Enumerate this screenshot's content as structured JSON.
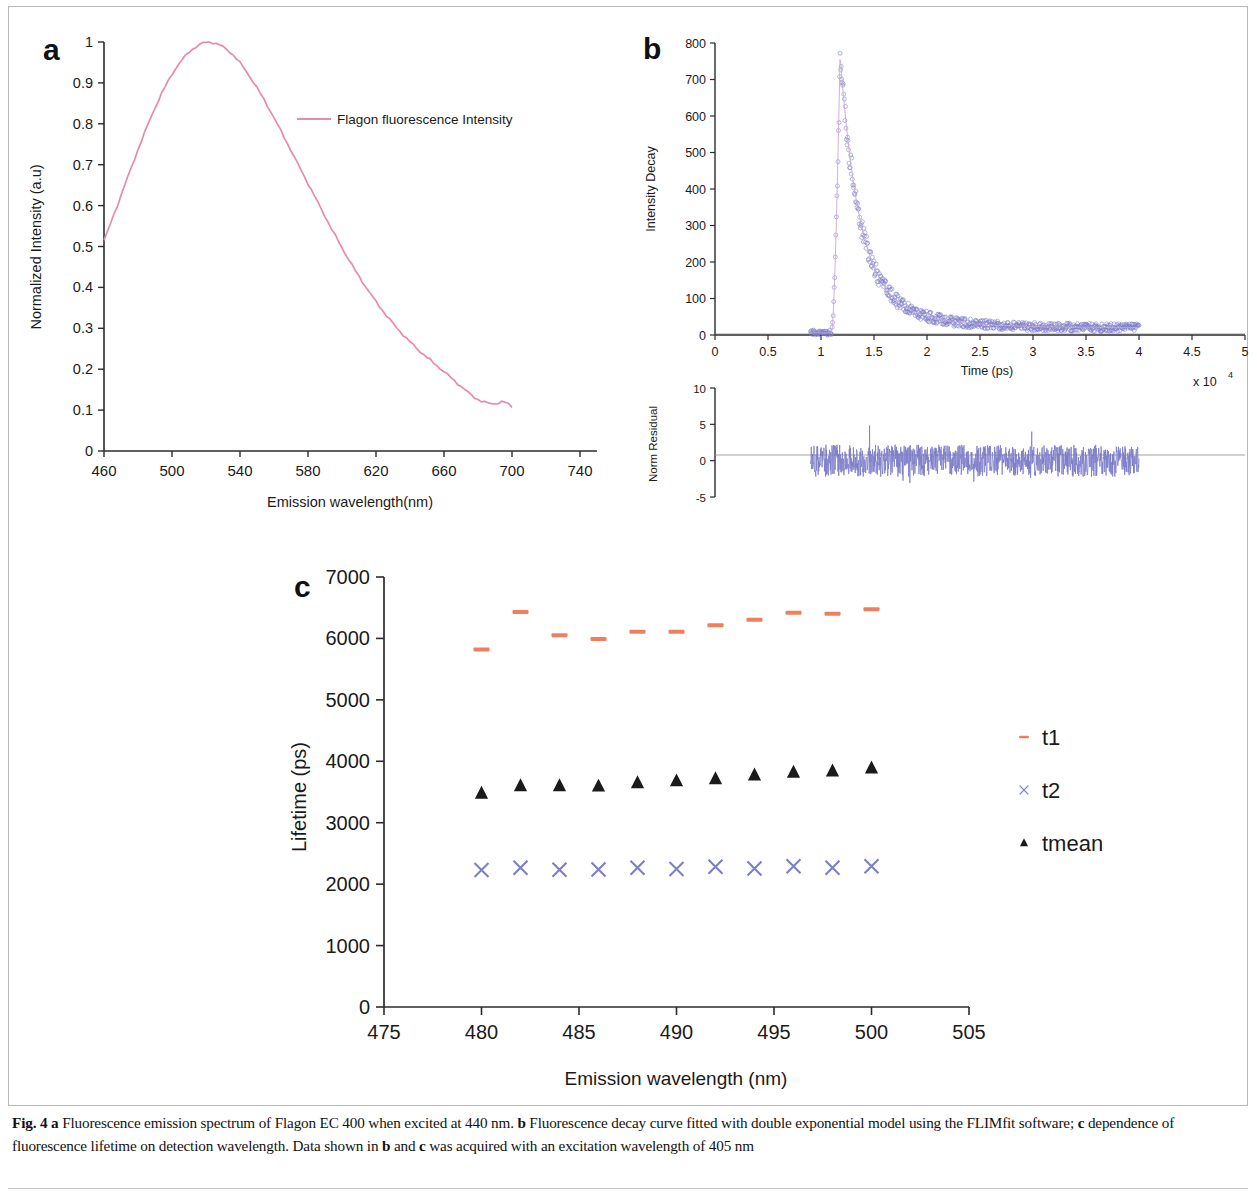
{
  "figure": {
    "caption_label": "Fig. 4",
    "caption_segments": [
      {
        "text": "Fig. 4",
        "bold": true
      },
      {
        "text": " ",
        "bold": false
      },
      {
        "text": "a",
        "bold": true
      },
      {
        "text": " Fluorescence emission spectrum of Flagon EC 400 when excited at 440 nm. ",
        "bold": false
      },
      {
        "text": "b",
        "bold": true
      },
      {
        "text": " Fluorescence decay curve fitted with double exponential model using the FLIMfit software; ",
        "bold": false
      },
      {
        "text": "c",
        "bold": true
      },
      {
        "text": " dependence of fluorescence lifetime on detection wavelength. Data shown in ",
        "bold": false
      },
      {
        "text": "b",
        "bold": true
      },
      {
        "text": " and ",
        "bold": false
      },
      {
        "text": "c",
        "bold": true
      },
      {
        "text": " was acquired with an excitation wavelength of 405 nm",
        "bold": false
      }
    ],
    "caption_plain": "Fig. 4 a Fluorescence emission spectrum of Flagon EC 400 when excited at 440 nm. b Fluorescence decay curve fitted with double exponential model using the FLIMfit software; c dependence of fluorescence lifetime on detection wavelength. Data shown in b and c was acquired with an excitation wavelength of 405 nm"
  },
  "panel_a": {
    "letter": "a",
    "legend_label": "Flagon fluorescence Intensity",
    "line_color": "#e58bb0",
    "chart_data": {
      "type": "line",
      "title": "",
      "xlabel": "Emission wavelength(nm)",
      "ylabel": "Normalized Intensity (a.u)",
      "xlim": [
        460,
        750
      ],
      "ylim": [
        0,
        1
      ],
      "xticks": [
        460,
        500,
        540,
        580,
        620,
        660,
        700,
        740
      ],
      "yticks": [
        0,
        0.1,
        0.2,
        0.3,
        0.4,
        0.5,
        0.6,
        0.7,
        0.8,
        0.9,
        1
      ],
      "grid": false,
      "legend_position": "inside-upper-right",
      "series": [
        {
          "name": "Flagon fluorescence Intensity",
          "color": "#e58bb0",
          "x": [
            460,
            462,
            464,
            466,
            468,
            470,
            472,
            474,
            476,
            478,
            480,
            482,
            484,
            486,
            488,
            490,
            492,
            494,
            496,
            498,
            500,
            502,
            504,
            506,
            508,
            510,
            512,
            514,
            516,
            518,
            520,
            522,
            524,
            526,
            528,
            530,
            532,
            534,
            536,
            538,
            540,
            542,
            544,
            546,
            548,
            550,
            552,
            554,
            556,
            558,
            560,
            562,
            564,
            566,
            568,
            570,
            572,
            574,
            576,
            578,
            580,
            582,
            584,
            586,
            588,
            590,
            592,
            594,
            596,
            598,
            600,
            602,
            604,
            606,
            608,
            610,
            612,
            614,
            616,
            618,
            620,
            622,
            624,
            626,
            628,
            630,
            632,
            634,
            636,
            638,
            640,
            642,
            644,
            646,
            648,
            650,
            652,
            654,
            656,
            658,
            660,
            662,
            664,
            666,
            668,
            670,
            672,
            674,
            676,
            678,
            680,
            682,
            684,
            686,
            688,
            690,
            692,
            694,
            696,
            698,
            700
          ],
          "y": [
            0.515,
            0.535,
            0.558,
            0.58,
            0.602,
            0.625,
            0.648,
            0.67,
            0.692,
            0.714,
            0.737,
            0.758,
            0.779,
            0.8,
            0.82,
            0.839,
            0.857,
            0.875,
            0.891,
            0.906,
            0.921,
            0.934,
            0.946,
            0.957,
            0.966,
            0.975,
            0.982,
            0.988,
            0.993,
            0.997,
            0.999,
            1.0,
            0.999,
            0.996,
            0.993,
            0.988,
            0.982,
            0.976,
            0.968,
            0.959,
            0.949,
            0.938,
            0.926,
            0.914,
            0.901,
            0.888,
            0.874,
            0.86,
            0.845,
            0.83,
            0.815,
            0.799,
            0.783,
            0.767,
            0.751,
            0.735,
            0.718,
            0.702,
            0.686,
            0.67,
            0.654,
            0.638,
            0.622,
            0.606,
            0.59,
            0.574,
            0.558,
            0.542,
            0.527,
            0.512,
            0.497,
            0.482,
            0.468,
            0.454,
            0.44,
            0.427,
            0.414,
            0.401,
            0.389,
            0.377,
            0.365,
            0.354,
            0.343,
            0.332,
            0.322,
            0.312,
            0.302,
            0.293,
            0.284,
            0.275,
            0.267,
            0.259,
            0.251,
            0.243,
            0.236,
            0.229,
            0.222,
            0.215,
            0.208,
            0.201,
            0.194,
            0.187,
            0.18,
            0.172,
            0.165,
            0.158,
            0.151,
            0.144,
            0.137,
            0.131,
            0.126,
            0.122,
            0.119,
            0.117,
            0.116,
            0.116,
            0.118,
            0.12,
            0.119,
            0.114,
            0.108
          ]
        }
      ]
    }
  },
  "panel_b": {
    "letter": "b",
    "decay_color": "#7b7bc8",
    "chart_data": {
      "type": "scatter",
      "title": "",
      "xlabel": "Time (ps)",
      "ylabel": "Intensity Decay",
      "x_exponent_label": "x 10",
      "x_exponent_power": "4",
      "xlim": [
        0,
        5
      ],
      "ylim": [
        0,
        800
      ],
      "xticks": [
        0,
        0.5,
        1,
        1.5,
        2,
        2.5,
        3,
        3.5,
        4,
        4.5,
        5
      ],
      "yticks": [
        0,
        100,
        200,
        300,
        400,
        500,
        600,
        700,
        800
      ],
      "grid": false,
      "description": "IRF-convolved double-exponential decay; data circles overlaid with fit line. Baseline near zero from 0.9e4, sharp rise at 1.1e4 to peak ~770 at 1.18e4, exponential decay to ~20 by 2.6e4, flat tail to 4.0e4.",
      "peak_value": 770,
      "peak_time": 1.18,
      "rise_time": 1.1,
      "data_start": 0.9,
      "data_end": 4.0
    },
    "residual": {
      "type": "line",
      "ylabel": "Norm Residual",
      "ylim": [
        -5,
        10
      ],
      "yticks": [
        -5,
        0,
        5,
        10
      ],
      "xlim": [
        0,
        5
      ],
      "color": "#7b7bc8",
      "noise_amplitude": 2.2,
      "data_start": 0.9,
      "data_end": 4.0
    }
  },
  "panel_c": {
    "letter": "c",
    "chart_data": {
      "type": "scatter",
      "title": "",
      "xlabel": "Emission  wavelength (nm)",
      "ylabel": "Lifetime (ps)",
      "xlim": [
        475,
        505
      ],
      "ylim": [
        0,
        7000
      ],
      "xticks": [
        475,
        480,
        485,
        490,
        495,
        500,
        505
      ],
      "yticks": [
        0,
        1000,
        2000,
        3000,
        4000,
        5000,
        6000,
        7000
      ],
      "grid": false,
      "legend_position": "right",
      "categories": [
        480,
        482,
        484,
        486,
        488,
        490,
        492,
        494,
        496,
        498,
        500
      ],
      "series": [
        {
          "name": "t1",
          "marker": "dash",
          "color": "#ef7f5f",
          "values": [
            5820,
            6430,
            6050,
            5990,
            6110,
            6110,
            6215,
            6305,
            6420,
            6400,
            6475
          ]
        },
        {
          "name": "t2",
          "marker": "cross",
          "color": "#7b80c6",
          "values": [
            2230,
            2265,
            2235,
            2240,
            2265,
            2245,
            2285,
            2255,
            2290,
            2265,
            2290
          ]
        },
        {
          "name": "tmean",
          "marker": "triangle",
          "color": "#1a1a1a",
          "values": [
            3480,
            3600,
            3600,
            3595,
            3650,
            3680,
            3715,
            3775,
            3820,
            3840,
            3890
          ]
        }
      ]
    },
    "legend": [
      {
        "label": "t1",
        "marker": "dash",
        "color": "#ef7f5f"
      },
      {
        "label": "t2",
        "marker": "cross",
        "color": "#7b80c6"
      },
      {
        "label": "tmean",
        "marker": "triangle",
        "color": "#1a1a1a"
      }
    ]
  }
}
